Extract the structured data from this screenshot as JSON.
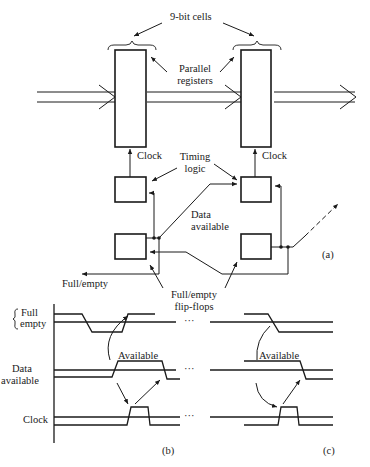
{
  "figure": {
    "part_a": {
      "label": "(a)",
      "cells_label": "9-bit cells",
      "registers_label_line1": "Parallel",
      "registers_label_line2": "registers",
      "clock_label_left": "Clock",
      "clock_label_right": "Clock",
      "timing_logic_line1": "Timing",
      "timing_logic_line2": "logic",
      "data_available_line1": "Data",
      "data_available_line2": "available",
      "full_empty_output": "Full/empty",
      "flipflops_line1": "Full/empty",
      "flipflops_line2": "flip-flops"
    },
    "part_b": {
      "label": "(b)",
      "signal_full": "Full",
      "signal_empty": "empty",
      "signal_data_line1": "Data",
      "signal_data_line2": "available",
      "signal_clock": "Clock",
      "available_label": "Available",
      "ellipsis_1": "···",
      "ellipsis_2": "···",
      "ellipsis_3": "···"
    },
    "part_c": {
      "label": "(c)",
      "available_label": "Available"
    }
  },
  "colors": {
    "ink": "#1a1a1a",
    "background": "#ffffff"
  }
}
